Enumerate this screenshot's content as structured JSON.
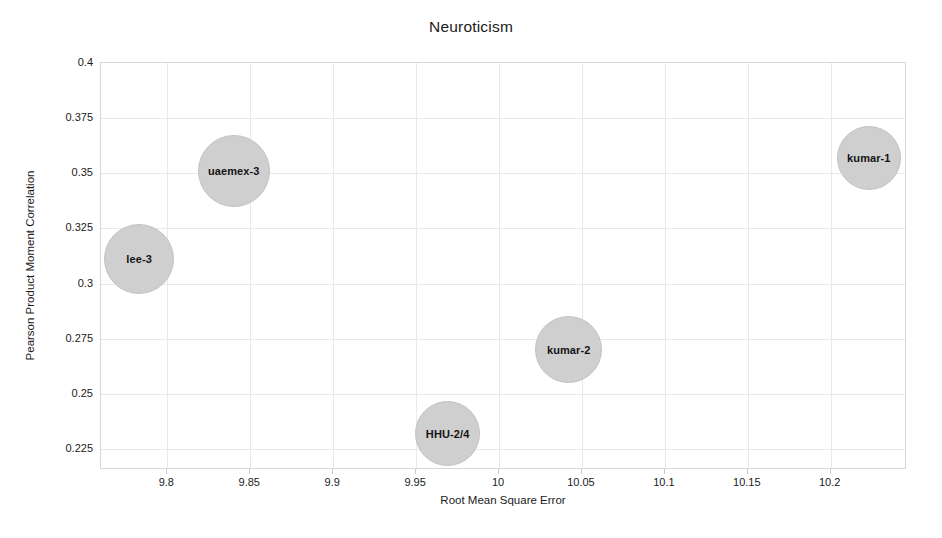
{
  "chart_data": {
    "type": "scatter",
    "title": "Neuroticism",
    "xlabel": "Root Mean Square Error",
    "ylabel": "Pearson Product Moment Correlation",
    "xlim": [
      9.76,
      10.246
    ],
    "ylim": [
      0.2155,
      0.4
    ],
    "xticks": [
      "9.8",
      "9.85",
      "9.9",
      "9.95",
      "10",
      "10.05",
      "10.1",
      "10.15",
      "10.2"
    ],
    "xtick_values": [
      9.8,
      9.85,
      9.9,
      9.95,
      10,
      10.05,
      10.1,
      10.15,
      10.2
    ],
    "yticks": [
      "0.4",
      "0.375",
      "0.35",
      "0.325",
      "0.3",
      "0.275",
      "0.25",
      "0.225"
    ],
    "ytick_values": [
      0.4,
      0.375,
      0.35,
      0.325,
      0.3,
      0.275,
      0.25,
      0.225
    ],
    "grid": true,
    "legend": "none",
    "bubble_color": "#cfcfcf",
    "points": [
      {
        "label": "lee-3",
        "x": 9.783,
        "y": 0.311,
        "size": 70
      },
      {
        "label": "uaemex-3",
        "x": 9.84,
        "y": 0.351,
        "size": 72
      },
      {
        "label": "HHU-2/4",
        "x": 9.969,
        "y": 0.232,
        "size": 65
      },
      {
        "label": "kumar-2",
        "x": 10.042,
        "y": 0.27,
        "size": 67
      },
      {
        "label": "kumar-1",
        "x": 10.223,
        "y": 0.357,
        "size": 64
      }
    ]
  }
}
